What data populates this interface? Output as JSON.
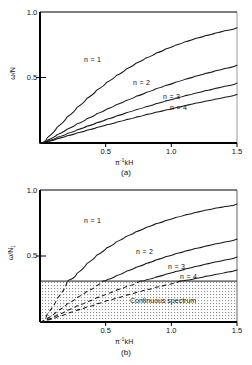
{
  "figure": {
    "panels": [
      {
        "id": "a",
        "caption": "(a)",
        "ylabel": "ω/N",
        "xlabel_pi": "π",
        "xlabel_exp": "-1",
        "xlabel_rest": "kH",
        "xlabel_full": "π⁻¹kH",
        "ytick_top": "1.0",
        "ytick_mid": "0.5",
        "xticks": [
          "0.5",
          "1.0",
          "1.5"
        ],
        "curve_labels": [
          "n = 1",
          "n = 2",
          "n = 3",
          "n = 4"
        ]
      },
      {
        "id": "b",
        "caption": "(b)",
        "ylabel_main": "ω/N",
        "ylabel_sub": "1",
        "xlabel_pi": "π",
        "xlabel_exp": "-1",
        "xlabel_rest": "kH",
        "xlabel_full": "π⁻¹kH",
        "ytick_top": "1.0",
        "ytick_mid": "0.5",
        "xticks": [
          "0.5",
          "1.0",
          "1.5"
        ],
        "curve_labels": [
          "n = 1",
          "n = 2",
          "n = 3",
          "n = 4"
        ],
        "region_label": "Continuous spectrum"
      }
    ],
    "colors": {
      "line": "#1a1a1a",
      "axis": "#000000",
      "shading": "#c8c8c8",
      "background": "#ffffff"
    }
  },
  "chart_data": [
    {
      "type": "line",
      "panel": "a",
      "title": "",
      "xlabel": "π⁻¹kH",
      "ylabel": "ω/N",
      "xlim": [
        0,
        1.5
      ],
      "ylim": [
        0,
        1.0
      ],
      "xticks": [
        0.5,
        1.0,
        1.5
      ],
      "yticks": [
        0.5,
        1.0
      ],
      "grid": false,
      "legend": "inline-curve-labels",
      "series": [
        {
          "name": "n = 1",
          "x": [
            0,
            0.075,
            0.15,
            0.225,
            0.3,
            0.375,
            0.45,
            0.525,
            0.6,
            0.675,
            0.75,
            0.825,
            0.9,
            0.975,
            1.05,
            1.125,
            1.2,
            1.275,
            1.35,
            1.425,
            1.5
          ],
          "y": [
            0,
            0.082,
            0.161,
            0.236,
            0.307,
            0.373,
            0.434,
            0.49,
            0.541,
            0.588,
            0.63,
            0.668,
            0.702,
            0.733,
            0.761,
            0.786,
            0.809,
            0.829,
            0.848,
            0.865,
            0.88
          ]
        },
        {
          "name": "n = 2",
          "x": [
            0,
            0.075,
            0.15,
            0.225,
            0.3,
            0.375,
            0.45,
            0.525,
            0.6,
            0.675,
            0.75,
            0.825,
            0.9,
            0.975,
            1.05,
            1.125,
            1.2,
            1.275,
            1.35,
            1.425,
            1.5
          ],
          "y": [
            0,
            0.043,
            0.085,
            0.126,
            0.166,
            0.204,
            0.241,
            0.276,
            0.309,
            0.341,
            0.371,
            0.4,
            0.427,
            0.452,
            0.476,
            0.499,
            0.52,
            0.54,
            0.559,
            0.577,
            0.594
          ]
        },
        {
          "name": "n = 3",
          "x": [
            0,
            0.075,
            0.15,
            0.225,
            0.3,
            0.375,
            0.45,
            0.525,
            0.6,
            0.675,
            0.75,
            0.825,
            0.9,
            0.975,
            1.05,
            1.125,
            1.2,
            1.275,
            1.35,
            1.425,
            1.5
          ],
          "y": [
            0,
            0.029,
            0.058,
            0.086,
            0.114,
            0.141,
            0.168,
            0.194,
            0.219,
            0.243,
            0.266,
            0.289,
            0.311,
            0.332,
            0.352,
            0.371,
            0.39,
            0.408,
            0.425,
            0.441,
            0.457
          ]
        },
        {
          "name": "n = 4",
          "x": [
            0,
            0.075,
            0.15,
            0.225,
            0.3,
            0.375,
            0.45,
            0.525,
            0.6,
            0.675,
            0.75,
            0.825,
            0.9,
            0.975,
            1.05,
            1.125,
            1.2,
            1.275,
            1.35,
            1.425,
            1.5
          ],
          "y": [
            0,
            0.022,
            0.044,
            0.066,
            0.087,
            0.108,
            0.129,
            0.149,
            0.169,
            0.188,
            0.207,
            0.226,
            0.244,
            0.261,
            0.278,
            0.295,
            0.311,
            0.327,
            0.342,
            0.357,
            0.371
          ]
        }
      ]
    },
    {
      "type": "line",
      "panel": "b",
      "title": "",
      "xlabel": "π⁻¹kH",
      "ylabel": "ω/N₁",
      "xlim": [
        0,
        1.5
      ],
      "ylim": [
        0,
        1.0
      ],
      "xticks": [
        0.5,
        1.0,
        1.5
      ],
      "yticks": [
        0.5,
        1.0
      ],
      "grid": false,
      "legend": "inline-curve-labels",
      "shaded_region": {
        "label": "Continuous spectrum",
        "y_range": [
          0,
          0.31
        ],
        "x_range": [
          0,
          1.5
        ]
      },
      "note": "Curve segments inside the shaded continuous-spectrum band are drawn dashed; segments above are solid.",
      "series": [
        {
          "name": "n = 1",
          "x": [
            0,
            0.075,
            0.15,
            0.225,
            0.3,
            0.375,
            0.45,
            0.525,
            0.6,
            0.675,
            0.75,
            0.825,
            0.9,
            0.975,
            1.05,
            1.125,
            1.2,
            1.275,
            1.35,
            1.425,
            1.5
          ],
          "y": [
            0,
            0.125,
            0.235,
            0.328,
            0.408,
            0.476,
            0.535,
            0.585,
            0.629,
            0.667,
            0.701,
            0.731,
            0.757,
            0.781,
            0.802,
            0.821,
            0.838,
            0.854,
            0.868,
            0.881,
            0.893
          ]
        },
        {
          "name": "n = 2",
          "x": [
            0,
            0.075,
            0.15,
            0.225,
            0.3,
            0.375,
            0.45,
            0.525,
            0.6,
            0.675,
            0.75,
            0.825,
            0.9,
            0.975,
            1.05,
            1.125,
            1.2,
            1.275,
            1.35,
            1.425,
            1.5
          ],
          "y": [
            0,
            0.057,
            0.111,
            0.162,
            0.21,
            0.254,
            0.295,
            0.333,
            0.368,
            0.4,
            0.43,
            0.457,
            0.483,
            0.506,
            0.528,
            0.548,
            0.566,
            0.583,
            0.599,
            0.614,
            0.628
          ]
        },
        {
          "name": "n = 3",
          "x": [
            0,
            0.075,
            0.15,
            0.225,
            0.3,
            0.375,
            0.45,
            0.525,
            0.6,
            0.675,
            0.75,
            0.825,
            0.9,
            0.975,
            1.05,
            1.125,
            1.2,
            1.275,
            1.35,
            1.425,
            1.5
          ],
          "y": [
            0,
            0.036,
            0.071,
            0.105,
            0.138,
            0.169,
            0.199,
            0.228,
            0.255,
            0.281,
            0.306,
            0.329,
            0.351,
            0.372,
            0.392,
            0.411,
            0.429,
            0.446,
            0.462,
            0.477,
            0.492
          ]
        },
        {
          "name": "n = 4",
          "x": [
            0,
            0.075,
            0.15,
            0.225,
            0.3,
            0.375,
            0.45,
            0.525,
            0.6,
            0.675,
            0.75,
            0.825,
            0.9,
            0.975,
            1.05,
            1.125,
            1.2,
            1.275,
            1.35,
            1.425,
            1.5
          ],
          "y": [
            0,
            0.026,
            0.052,
            0.078,
            0.102,
            0.126,
            0.149,
            0.172,
            0.193,
            0.214,
            0.234,
            0.253,
            0.272,
            0.289,
            0.306,
            0.322,
            0.338,
            0.353,
            0.367,
            0.381,
            0.394
          ]
        }
      ]
    }
  ]
}
